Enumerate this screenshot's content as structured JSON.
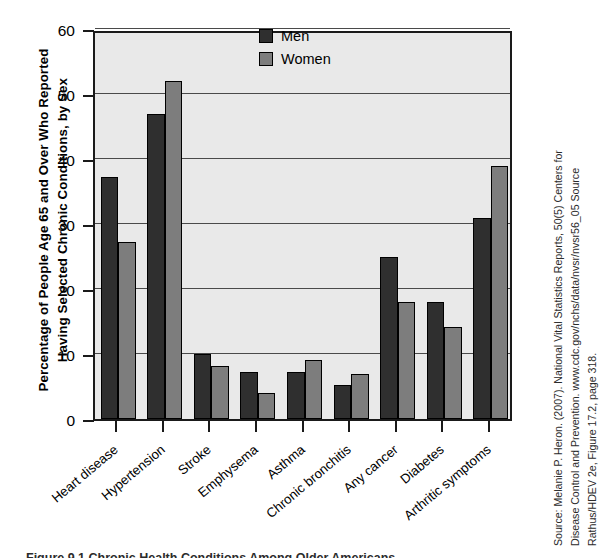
{
  "chart_data": {
    "type": "bar",
    "title": "",
    "ylabel": "Percentage of People Age 65 and Over Who Reported Having Selected Chronic Conditions, by Sex",
    "ylabel_lines": [
      "Percentage of People Age 65 and Over Who Reported",
      "Having Selected Chronic Conditions, by Sex"
    ],
    "xlabel": "",
    "categories": [
      "Heart disease",
      "Hypertension",
      "Stroke",
      "Emphysema",
      "Asthma",
      "Chronic bronchitis",
      "Any cancer",
      "Diabetes",
      "Arthritic symptoms"
    ],
    "series": [
      {
        "name": "Men",
        "color": "#2f2f2f",
        "values": [
          37.3,
          47,
          10,
          7.2,
          7.2,
          5.2,
          25,
          18,
          31
        ]
      },
      {
        "name": "Women",
        "color": "#7d7d7d",
        "values": [
          27.3,
          52,
          8.2,
          4,
          9.1,
          7,
          18,
          14.2,
          39
        ]
      }
    ],
    "ylim": [
      0,
      60
    ],
    "yticks": [
      0,
      10,
      20,
      30,
      40,
      50,
      60
    ],
    "ytick_labels": [
      "0",
      "10",
      "20",
      "30",
      "40",
      "50",
      "60"
    ],
    "grid": true,
    "legend_position": "top-center",
    "plot_background": "#e9e9e9"
  },
  "legend": {
    "entries": [
      {
        "label": "Men"
      },
      {
        "label": "Women"
      }
    ]
  },
  "source_note": {
    "lines": [
      "Source: Melanie P. Heron. (2007). National Vital Statistics Reports, 50(5) Centers for",
      "Disease Control and Prevention. www.cdc.gov/nchs/data/nvsr/nvsr56_05 Source",
      "Rathus/HDEV 2e, Figure 17.2, page 318."
    ]
  },
  "caption": {
    "text": "Figure 9.1  Chronic Health Conditions Among Older Americans"
  }
}
